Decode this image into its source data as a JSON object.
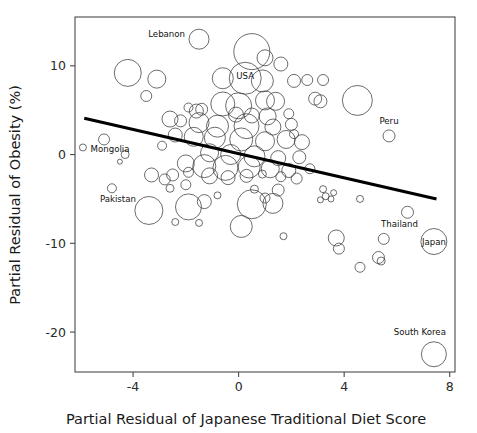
{
  "chart_data": {
    "type": "scatter",
    "title": "",
    "xlabel": "Partial Residual of Japanese Traditional Diet Score",
    "ylabel": "Partial Residual of Obesity (%)",
    "xlim": [
      -6.2,
      8.2
    ],
    "ylim": [
      -24.5,
      15.5
    ],
    "xticks": [
      -4,
      0,
      4,
      8
    ],
    "xtick_labels": [
      "-4",
      "0",
      "4",
      "8"
    ],
    "yticks": [
      10,
      0,
      -10,
      -20
    ],
    "ytick_labels": [
      "10",
      "0",
      "-10",
      "-20"
    ],
    "grid": false,
    "legend": "none",
    "marker_style": "open-circle-variable-size",
    "stroke_color": "#3b3b3b",
    "fit_line": {
      "type": "linear-regression",
      "color": "#000000",
      "x_start": -5.85,
      "y_start": 4.1,
      "x_end": 7.5,
      "y_end": -5.0
    },
    "annotations": [
      {
        "label": "Lebanon",
        "x": -1.5,
        "y": 13.0,
        "r": 10.0
      },
      {
        "label": "USA",
        "x": 0.25,
        "y": 8.6,
        "r": 16.0
      },
      {
        "label": "Peru",
        "x": 5.7,
        "y": 2.1,
        "r": 6.0
      },
      {
        "label": "Mongolia",
        "x": -5.1,
        "y": 1.7,
        "r": 5.5
      },
      {
        "label": "Pakistan",
        "x": -4.8,
        "y": -3.8,
        "r": 4.5
      },
      {
        "label": "Thailand",
        "x": 6.4,
        "y": -6.5,
        "r": 6.0
      },
      {
        "label": "Japan",
        "x": 7.4,
        "y": -9.8,
        "r": 13.0
      },
      {
        "label": "South Korea",
        "x": 7.4,
        "y": -22.5,
        "r": 12.5
      }
    ],
    "points": [
      {
        "x": -1.5,
        "y": 13.0,
        "r": 10.0
      },
      {
        "x": 0.5,
        "y": 11.6,
        "r": 18.0
      },
      {
        "x": 1.0,
        "y": 10.9,
        "r": 8.0
      },
      {
        "x": 1.6,
        "y": 10.2,
        "r": 7.0
      },
      {
        "x": 0.25,
        "y": 8.6,
        "r": 16.0
      },
      {
        "x": -4.2,
        "y": 9.2,
        "r": 13.5
      },
      {
        "x": -3.1,
        "y": 8.5,
        "r": 9.0
      },
      {
        "x": -0.6,
        "y": 8.6,
        "r": 10.5
      },
      {
        "x": 0.9,
        "y": 8.3,
        "r": 11.0
      },
      {
        "x": 2.1,
        "y": 8.3,
        "r": 6.5
      },
      {
        "x": 2.6,
        "y": 8.4,
        "r": 5.5
      },
      {
        "x": 3.2,
        "y": 8.4,
        "r": 5.5
      },
      {
        "x": -3.5,
        "y": 6.6,
        "r": 5.5
      },
      {
        "x": 4.5,
        "y": 6.1,
        "r": 15.0
      },
      {
        "x": 2.9,
        "y": 6.3,
        "r": 6.5
      },
      {
        "x": 3.1,
        "y": 6.0,
        "r": 6.5
      },
      {
        "x": -0.6,
        "y": 5.7,
        "r": 12.0
      },
      {
        "x": 0.0,
        "y": 5.5,
        "r": 13.0
      },
      {
        "x": 1.0,
        "y": 6.1,
        "r": 9.5
      },
      {
        "x": 1.4,
        "y": 6.0,
        "r": 9.0
      },
      {
        "x": -1.6,
        "y": 4.9,
        "r": 7.0
      },
      {
        "x": -1.4,
        "y": 5.1,
        "r": 6.0
      },
      {
        "x": -1.9,
        "y": 5.3,
        "r": 4.5
      },
      {
        "x": -0.1,
        "y": 4.5,
        "r": 7.5
      },
      {
        "x": 0.5,
        "y": 4.4,
        "r": 7.5
      },
      {
        "x": 1.1,
        "y": 4.3,
        "r": 8.5
      },
      {
        "x": 1.9,
        "y": 4.6,
        "r": 5.0
      },
      {
        "x": -2.6,
        "y": 4.0,
        "r": 8.0
      },
      {
        "x": -2.2,
        "y": 3.8,
        "r": 6.0
      },
      {
        "x": -1.5,
        "y": 3.6,
        "r": 10.0
      },
      {
        "x": -0.8,
        "y": 3.2,
        "r": 11.0
      },
      {
        "x": 0.3,
        "y": 3.2,
        "r": 12.5
      },
      {
        "x": 1.3,
        "y": 3.1,
        "r": 8.0
      },
      {
        "x": 2.0,
        "y": 3.4,
        "r": 6.0
      },
      {
        "x": 5.7,
        "y": 2.1,
        "r": 6.0
      },
      {
        "x": -5.1,
        "y": 1.7,
        "r": 5.5
      },
      {
        "x": -5.9,
        "y": 0.8,
        "r": 3.5
      },
      {
        "x": -2.4,
        "y": 2.2,
        "r": 7.0
      },
      {
        "x": -1.7,
        "y": 2.0,
        "r": 9.5
      },
      {
        "x": -0.9,
        "y": 1.9,
        "r": 10.5
      },
      {
        "x": 0.1,
        "y": 1.7,
        "r": 11.5
      },
      {
        "x": 1.0,
        "y": 1.5,
        "r": 9.5
      },
      {
        "x": 1.8,
        "y": 1.7,
        "r": 9.0
      },
      {
        "x": 2.4,
        "y": 1.4,
        "r": 7.5
      },
      {
        "x": 2.1,
        "y": 2.3,
        "r": 4.5
      },
      {
        "x": -2.9,
        "y": 1.0,
        "r": 4.5
      },
      {
        "x": -4.3,
        "y": 0.0,
        "r": 4.0
      },
      {
        "x": -4.5,
        "y": -0.8,
        "r": 2.5
      },
      {
        "x": -1.1,
        "y": 0.2,
        "r": 9.0
      },
      {
        "x": -0.3,
        "y": 0.0,
        "r": 10.0
      },
      {
        "x": 0.6,
        "y": -0.2,
        "r": 10.5
      },
      {
        "x": 1.5,
        "y": -0.4,
        "r": 7.5
      },
      {
        "x": 2.3,
        "y": -0.3,
        "r": 6.5
      },
      {
        "x": -2.0,
        "y": -1.0,
        "r": 8.5
      },
      {
        "x": -1.3,
        "y": -1.3,
        "r": 11.5
      },
      {
        "x": -0.5,
        "y": -1.5,
        "r": 12.5
      },
      {
        "x": 0.4,
        "y": -1.4,
        "r": 11.0
      },
      {
        "x": 1.2,
        "y": -1.6,
        "r": 9.0
      },
      {
        "x": 1.9,
        "y": -1.8,
        "r": 7.0
      },
      {
        "x": 2.7,
        "y": -1.6,
        "r": 5.0
      },
      {
        "x": -2.5,
        "y": -2.3,
        "r": 6.0
      },
      {
        "x": -1.9,
        "y": -2.0,
        "r": 5.0
      },
      {
        "x": -1.1,
        "y": -2.4,
        "r": 8.0
      },
      {
        "x": -0.4,
        "y": -2.6,
        "r": 7.0
      },
      {
        "x": 0.3,
        "y": -2.4,
        "r": 6.5
      },
      {
        "x": 0.9,
        "y": -2.2,
        "r": 4.0
      },
      {
        "x": 1.6,
        "y": -2.5,
        "r": 5.0
      },
      {
        "x": 2.2,
        "y": -2.7,
        "r": 5.5
      },
      {
        "x": -3.3,
        "y": -2.3,
        "r": 7.0
      },
      {
        "x": -2.8,
        "y": -2.8,
        "r": 5.5
      },
      {
        "x": -2.0,
        "y": -3.4,
        "r": 5.0
      },
      {
        "x": -2.6,
        "y": -3.8,
        "r": 4.0
      },
      {
        "x": -4.8,
        "y": -3.8,
        "r": 4.5
      },
      {
        "x": 0.6,
        "y": -3.9,
        "r": 4.0
      },
      {
        "x": 1.5,
        "y": -4.0,
        "r": 6.0
      },
      {
        "x": 3.2,
        "y": -3.9,
        "r": 3.5
      },
      {
        "x": 3.6,
        "y": -4.3,
        "r": 3.0
      },
      {
        "x": 3.3,
        "y": -4.7,
        "r": 3.5
      },
      {
        "x": 3.1,
        "y": -5.1,
        "r": 3.0
      },
      {
        "x": 3.5,
        "y": -5.0,
        "r": 3.0
      },
      {
        "x": 4.6,
        "y": -5.0,
        "r": 3.5
      },
      {
        "x": -3.4,
        "y": -6.3,
        "r": 14.0
      },
      {
        "x": -1.9,
        "y": -5.9,
        "r": 13.0
      },
      {
        "x": -1.3,
        "y": -5.3,
        "r": 7.0
      },
      {
        "x": 0.5,
        "y": -5.6,
        "r": 14.5
      },
      {
        "x": 1.3,
        "y": -5.5,
        "r": 10.0
      },
      {
        "x": 1.0,
        "y": -4.9,
        "r": 5.0
      },
      {
        "x": -0.8,
        "y": -4.6,
        "r": 3.5
      },
      {
        "x": -2.4,
        "y": -7.6,
        "r": 3.5
      },
      {
        "x": -1.5,
        "y": -7.7,
        "r": 3.5
      },
      {
        "x": 0.1,
        "y": -8.1,
        "r": 11.0
      },
      {
        "x": 1.7,
        "y": -9.2,
        "r": 3.5
      },
      {
        "x": 6.4,
        "y": -6.5,
        "r": 6.0
      },
      {
        "x": 3.7,
        "y": -9.4,
        "r": 8.0
      },
      {
        "x": 3.8,
        "y": -10.6,
        "r": 5.5
      },
      {
        "x": 5.5,
        "y": -9.5,
        "r": 5.5
      },
      {
        "x": 7.4,
        "y": -9.8,
        "r": 13.0
      },
      {
        "x": 4.6,
        "y": -12.7,
        "r": 5.0
      },
      {
        "x": 5.3,
        "y": -11.6,
        "r": 6.0
      },
      {
        "x": 5.4,
        "y": -12.0,
        "r": 4.0
      },
      {
        "x": 7.4,
        "y": -22.5,
        "r": 12.5
      }
    ]
  }
}
